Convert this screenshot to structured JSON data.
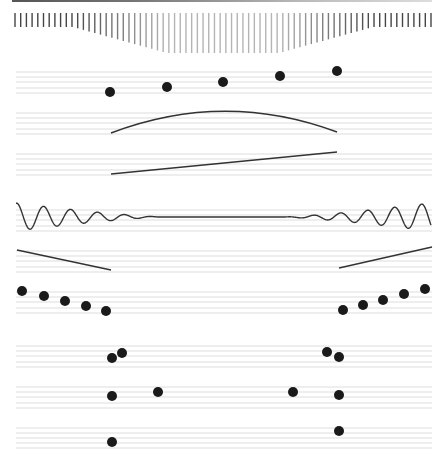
{
  "canvas": {
    "width": 446,
    "height": 462,
    "background": "#ffffff"
  },
  "colors": {
    "ink": "#1a1a1a",
    "staff": "#d4d4d4",
    "curve": "#333333"
  },
  "comb": {
    "x_start": 15,
    "x_end": 431,
    "count": 74,
    "top": 13,
    "min_len": 14,
    "max_len": 40,
    "center_x": 223,
    "flat_half_width": 150
  },
  "staves": [
    {
      "name": "staff-a",
      "x1": 16,
      "x2": 432,
      "lines": [
        72,
        77,
        82,
        88,
        93
      ]
    },
    {
      "name": "staff-b",
      "x1": 16,
      "x2": 432,
      "lines": [
        113,
        118,
        123,
        129,
        134
      ]
    },
    {
      "name": "staff-c",
      "x1": 16,
      "x2": 432,
      "lines": [
        154,
        159,
        164,
        170,
        175
      ]
    },
    {
      "name": "staff-d",
      "x1": 16,
      "x2": 432,
      "lines": [
        210,
        215,
        220,
        226,
        231
      ]
    },
    {
      "name": "staff-e",
      "x1": 16,
      "x2": 432,
      "lines": [
        251,
        256,
        261,
        267,
        272
      ]
    },
    {
      "name": "staff-f",
      "x1": 16,
      "x2": 432,
      "lines": [
        292,
        297,
        302,
        308,
        313
      ]
    },
    {
      "name": "staff-g",
      "x1": 16,
      "x2": 432,
      "lines": [
        346,
        351,
        356,
        362,
        367
      ]
    },
    {
      "name": "staff-h",
      "x1": 16,
      "x2": 432,
      "lines": [
        387,
        392,
        397,
        403,
        408
      ]
    },
    {
      "name": "staff-i",
      "x1": 16,
      "x2": 432,
      "lines": [
        428,
        433,
        438,
        443,
        448
      ]
    }
  ],
  "dots": [
    {
      "x": 110,
      "y": 92
    },
    {
      "x": 167,
      "y": 87
    },
    {
      "x": 223,
      "y": 82
    },
    {
      "x": 280,
      "y": 76
    },
    {
      "x": 337,
      "y": 71
    },
    {
      "x": 22,
      "y": 291
    },
    {
      "x": 44,
      "y": 296
    },
    {
      "x": 65,
      "y": 301
    },
    {
      "x": 86,
      "y": 306
    },
    {
      "x": 106,
      "y": 311
    },
    {
      "x": 343,
      "y": 310
    },
    {
      "x": 363,
      "y": 305
    },
    {
      "x": 383,
      "y": 300
    },
    {
      "x": 404,
      "y": 294
    },
    {
      "x": 425,
      "y": 289
    },
    {
      "x": 112,
      "y": 358
    },
    {
      "x": 122,
      "y": 353
    },
    {
      "x": 327,
      "y": 352
    },
    {
      "x": 339,
      "y": 357
    },
    {
      "x": 112,
      "y": 396
    },
    {
      "x": 158,
      "y": 392
    },
    {
      "x": 293,
      "y": 392
    },
    {
      "x": 339,
      "y": 395
    },
    {
      "x": 112,
      "y": 442
    },
    {
      "x": 339,
      "y": 431
    }
  ],
  "dot_radius": 5,
  "curves": [
    {
      "name": "arc",
      "d": "M111 133 Q 224 90 337 132"
    },
    {
      "name": "rising-line",
      "d": "M111 174 L 337 152"
    },
    {
      "name": "left-descending-line",
      "d": "M17 250 L 111 270"
    },
    {
      "name": "right-rising-line",
      "d": "M339 268 L 432 247"
    }
  ],
  "wave": {
    "x_start": 16,
    "x_end": 431,
    "center_y": 217,
    "max_amp": 14,
    "min_amp": 0,
    "period": 27,
    "flat_half_width": 60,
    "center_x": 223
  }
}
